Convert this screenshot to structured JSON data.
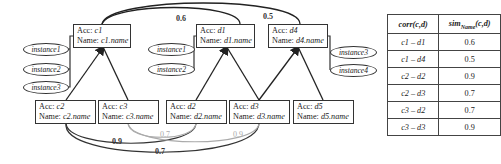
{
  "diagram": {
    "top_nodes": [
      {
        "id": "c1",
        "acc_label": "Acc: ",
        "acc_value": "c1",
        "name_label": "Name: ",
        "name_value": "c1.name"
      },
      {
        "id": "d1",
        "acc_label": "Acc: ",
        "acc_value": "d1",
        "name_label": "Name: ",
        "name_value": "d1.name"
      },
      {
        "id": "d4",
        "acc_label": "Acc: ",
        "acc_value": "d4",
        "name_label": "Name: ",
        "name_value": "d4.name"
      }
    ],
    "bottom_nodes": [
      {
        "id": "c2",
        "acc_label": "Acc: ",
        "acc_value": "c2",
        "name_label": "Name: ",
        "name_value": "c2.name"
      },
      {
        "id": "c3",
        "acc_label": "Acc: ",
        "acc_value": "c3",
        "name_label": "Name: ",
        "name_value": "c3.name"
      },
      {
        "id": "d2",
        "acc_label": "Acc: ",
        "acc_value": "d2",
        "name_label": "Name: ",
        "name_value": "d2.name"
      },
      {
        "id": "d3",
        "acc_label": "Acc: ",
        "acc_value": "d3",
        "name_label": "Name: ",
        "name_value": "d3.name"
      },
      {
        "id": "d5",
        "acc_label": "Acc: ",
        "acc_value": "d5",
        "name_label": "Name: ",
        "name_value": "d5.name"
      }
    ],
    "instances": {
      "c1": [
        "instance1",
        "instance2",
        "instance3"
      ],
      "d1": [
        "instance1",
        "instance2"
      ],
      "d4": [
        "instance3",
        "instance4"
      ]
    },
    "edge_labels": {
      "c1_d1": "0.6",
      "c1_d4": "0.5",
      "c2_d2": "0.9",
      "c2_d3": "0.7",
      "c3_d2": "0.7",
      "c3_d3": "0.9"
    }
  },
  "table": {
    "headers": [
      "corr(c,d)",
      "sim",
      "Name",
      "(c,d)"
    ],
    "rows": [
      {
        "pair": "c1 – d1",
        "sim": "0.6"
      },
      {
        "pair": "c1 – d4",
        "sim": "0.5"
      },
      {
        "pair": "c2 – d2",
        "sim": "0.9"
      },
      {
        "pair": "c2 – d3",
        "sim": "0.7"
      },
      {
        "pair": "c3 – d2",
        "sim": "0.7"
      },
      {
        "pair": "c3 – d3",
        "sim": "0.9"
      }
    ]
  }
}
